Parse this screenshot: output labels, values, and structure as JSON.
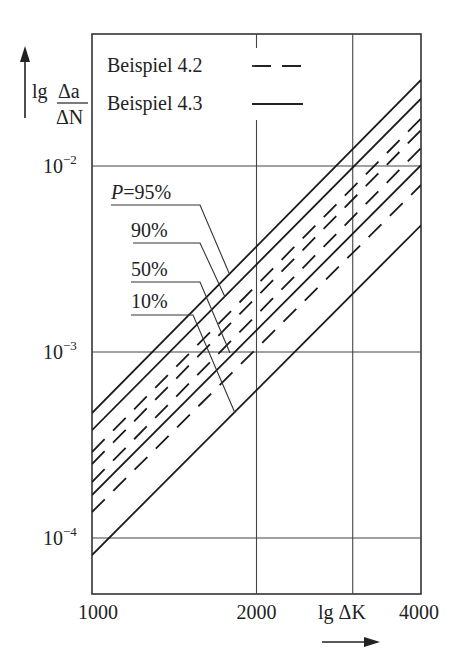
{
  "chart_data": {
    "type": "line",
    "title": "",
    "xlabel": "lg ΔK",
    "ylabel_prefix": "lg",
    "ylabel_num": "Δa",
    "ylabel_den": "ΔN",
    "xscale": "log",
    "yscale": "log",
    "xlim": [
      1000,
      4000
    ],
    "ylim": [
      4.65e-05,
      0.049
    ],
    "grid": true,
    "x_ticks": [
      1000,
      2000,
      4000
    ],
    "x_tick_labels": [
      "1000",
      "2000",
      "4000"
    ],
    "x_gridlines": [
      2000,
      3000
    ],
    "y_ticks": [
      0.01,
      0.001,
      0.0001
    ],
    "y_tick_labels": [
      {
        "base": "10",
        "exp": "−2"
      },
      {
        "base": "10",
        "exp": "−3"
      },
      {
        "base": "10",
        "exp": "−4"
      }
    ],
    "legend": {
      "placement": "top-left",
      "entries": [
        {
          "label": "Beispiel 4.2",
          "style": "dashed"
        },
        {
          "label": "Beispiel 4.3",
          "style": "solid"
        }
      ]
    },
    "series": [
      {
        "name": "Beispiel 4.3, P=95%",
        "example": "4.3",
        "P": "95%",
        "style": "solid",
        "x": [
          1000,
          4000
        ],
        "y": [
          0.00047,
          0.029
        ]
      },
      {
        "name": "Beispiel 4.3, P=90%",
        "example": "4.3",
        "P": "90%",
        "style": "solid",
        "x": [
          1000,
          4000
        ],
        "y": [
          0.00038,
          0.023
        ]
      },
      {
        "name": "Beispiel 4.2, P=95%",
        "example": "4.2",
        "P": "95%",
        "style": "dashed",
        "x": [
          1000,
          4000
        ],
        "y": [
          0.00029,
          0.018
        ]
      },
      {
        "name": "Beispiel 4.2, P=90%",
        "example": "4.2",
        "P": "90%",
        "style": "dashed",
        "x": [
          1000,
          4000
        ],
        "y": [
          0.00025,
          0.0156
        ]
      },
      {
        "name": "Beispiel 4.2, P=50%",
        "example": "4.2",
        "P": "50%",
        "style": "dashed",
        "x": [
          1000,
          4000
        ],
        "y": [
          0.0002,
          0.0125
        ]
      },
      {
        "name": "Beispiel 4.3, P=50%",
        "example": "4.3",
        "P": "50%",
        "style": "solid",
        "x": [
          1000,
          4000
        ],
        "y": [
          0.00017,
          0.0101
        ]
      },
      {
        "name": "Beispiel 4.2, P=10%",
        "example": "4.2",
        "P": "10%",
        "style": "dashed",
        "x": [
          1000,
          4000
        ],
        "y": [
          0.000138,
          0.0079
        ]
      },
      {
        "name": "Beispiel 4.3, P=10%",
        "example": "4.3",
        "P": "10%",
        "style": "solid",
        "x": [
          1000,
          4000
        ],
        "y": [
          8.1e-05,
          0.0048
        ]
      }
    ],
    "annotations": [
      {
        "text": "P=95%",
        "italic_prefix": "P",
        "value": "=95%",
        "points_to": {
          "x": 1680,
          "y": 0.0023
        }
      },
      {
        "text": "90%",
        "italic_prefix": "",
        "value": "90%",
        "points_to": {
          "x": 1670,
          "y": 0.0017
        }
      },
      {
        "text": "50%",
        "italic_prefix": "",
        "value": "50%",
        "points_to": {
          "x": 1730,
          "y": 0.001
        }
      },
      {
        "text": "10%",
        "italic_prefix": "",
        "value": "10%",
        "points_to": {
          "x": 1760,
          "y": 0.00048
        }
      }
    ]
  }
}
